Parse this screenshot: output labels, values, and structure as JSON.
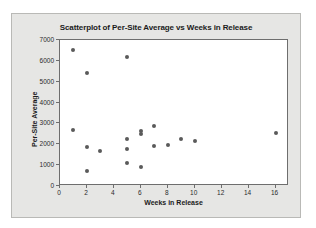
{
  "chart_data": {
    "type": "scatter",
    "title": "Scatterplot of Per-Site Average vs Weeks in Release",
    "xlabel": "Weeks in Release",
    "ylabel": "Per-Site Average",
    "xlim": [
      0,
      17
    ],
    "ylim": [
      0,
      7000
    ],
    "xticks": [
      0,
      2,
      4,
      6,
      8,
      10,
      12,
      14,
      16
    ],
    "xtick_labels": [
      "0",
      "2",
      "4",
      "6",
      "8",
      "10",
      "12",
      "14",
      "16"
    ],
    "yticks": [
      0,
      1000,
      2000,
      3000,
      4000,
      5000,
      6000,
      7000
    ],
    "ytick_labels": [
      "0",
      "1000",
      "2000",
      "3000",
      "4000",
      "5000",
      "6000",
      "7000"
    ],
    "grid": false,
    "legend": false,
    "marker_color": "#5a5a5a",
    "series": [
      {
        "name": "Per-Site Average",
        "x": [
          1,
          1,
          2,
          2,
          2,
          3,
          5,
          5,
          5,
          5,
          6,
          6,
          6,
          7,
          7,
          8,
          9,
          10,
          16
        ],
        "y": [
          6500,
          2700,
          5400,
          1850,
          700,
          1670,
          6200,
          2270,
          1780,
          1100,
          2640,
          2500,
          900,
          2900,
          1900,
          1970,
          2250,
          2140,
          2550
        ]
      }
    ]
  },
  "figure": {
    "background_color": "#e6e6e4",
    "plot_background_color": "#ffffff",
    "border_color": "#6e6e6e"
  }
}
